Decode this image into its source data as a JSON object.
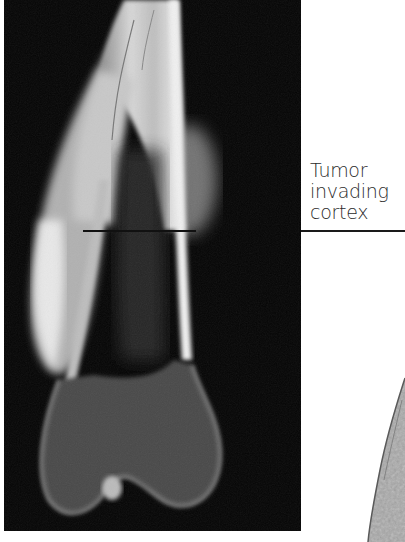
{
  "figure": {
    "xray": {
      "subject": "distal femur radiograph",
      "background_color": "#050505",
      "marker_line": {
        "x1": 83,
        "x2": 196,
        "y": 231
      }
    },
    "annotation": {
      "lines": [
        "Tumor",
        "invading",
        "cortex"
      ],
      "text_color": "#2b2b2b",
      "leader_color": "#1a1a1a"
    },
    "histology": {
      "subject": "gross specimen section (partial, right edge)",
      "color": "#9a9a9a"
    }
  }
}
